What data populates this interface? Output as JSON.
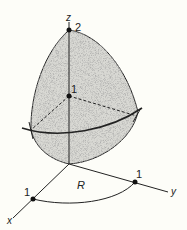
{
  "diagram": {
    "type": "3d-solid-over-region",
    "axes": {
      "z": {
        "label": "z"
      },
      "x": {
        "label": "x"
      },
      "y": {
        "label": "y"
      }
    },
    "points": [
      {
        "name": "z-top",
        "label": "2"
      },
      {
        "name": "z-mid",
        "label": "1"
      },
      {
        "name": "x-one",
        "label": "1"
      },
      {
        "name": "y-one",
        "label": "1"
      }
    ],
    "region": {
      "label": "R"
    },
    "colors": {
      "surface_fill": "#d9d9d4",
      "stroke": "#222222",
      "background": "#fdfdf8"
    }
  }
}
